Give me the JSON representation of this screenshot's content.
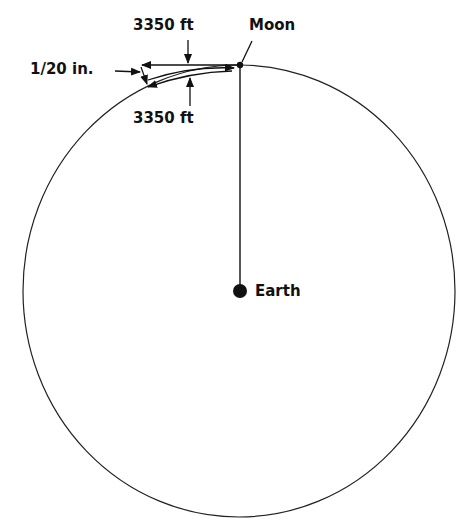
{
  "diagram": {
    "labels": {
      "moon": "Moon",
      "earth": "Earth",
      "horizontal_distance": "3350 ft",
      "arc_distance": "3350 ft",
      "fall_distance": "1/20 in."
    },
    "elements": {
      "orbit": "circle centered on Earth passing through Moon",
      "radius_line": "line from Moon to Earth",
      "tangent_line": "horizontal arrow from Moon, 3350 ft",
      "arc_path": "arrow along orbit from Moon, 3350 ft",
      "fall_gap": "small gap between tangent and orbit, 1/20 in."
    },
    "colors": {
      "stroke": "#111111",
      "background": "#ffffff"
    }
  }
}
